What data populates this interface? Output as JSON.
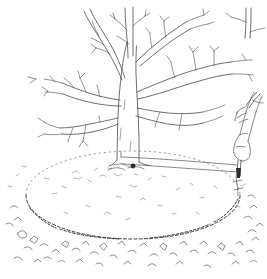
{
  "illustration": {
    "title": "Marking the drip line circle around a bare tree",
    "style": "black and white pen line drawing",
    "background_color": "#ffffff",
    "ink_color": "#4a4a4a",
    "width": 267,
    "height": 279,
    "elements": {
      "tree": {
        "name": "bare deciduous tree",
        "state": "leafless, dormant",
        "trunk_label": "tree trunk",
        "canopy_label": "bare branching canopy",
        "branch_count_main": 6
      },
      "hand": {
        "name": "human hand and forearm",
        "action": "gripping a marking stake pressed into the soil",
        "position": "right edge of the drawing"
      },
      "stake": {
        "name": "marking stake",
        "label": "stake"
      },
      "string": {
        "name": "measuring string",
        "label": "string tied to trunk base, drawn taut to the stake",
        "description": "radius line from trunk base to stake"
      },
      "circle": {
        "name": "scribed ground circle",
        "label": "drip line circle",
        "description": "dashed arc scratched into the soil around the tree"
      },
      "ground": {
        "name": "ground surface",
        "label": "soil with scattered grass and leaf litter"
      }
    }
  }
}
